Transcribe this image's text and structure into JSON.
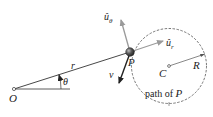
{
  "diagram": {
    "labels": {
      "origin": "O",
      "particle": "P",
      "center": "C",
      "radius_label": "R",
      "radial_distance": "r",
      "angle": "θ",
      "velocity": "v",
      "unit_theta_base": "û",
      "unit_theta_sub": "θ",
      "unit_r_base": "û",
      "unit_r_sub": "r",
      "path_caption_text": "path of ",
      "path_caption_var": "P"
    },
    "colors": {
      "line": "#333333",
      "unit_vector_arrow": "#9a9a9a",
      "velocity_arrow": "#222222",
      "circle": "#555555",
      "particle_fill": "#3a3a3a"
    }
  }
}
